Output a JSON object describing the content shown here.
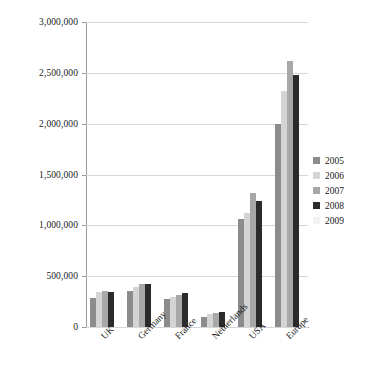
{
  "chart_data": {
    "type": "bar",
    "title": "",
    "subtitle": "",
    "xlabel": "",
    "ylabel": "",
    "categories": [
      "UK",
      "Germany",
      "France",
      "Netherlands",
      "USA",
      "Europe"
    ],
    "series": [
      {
        "name": "2005",
        "color": "#8c8c8c",
        "values": [
          290000,
          355000,
          280000,
          95000,
          1060000,
          2000000
        ]
      },
      {
        "name": "2006",
        "color": "#d4d4d4",
        "values": [
          345000,
          390000,
          300000,
          125000,
          1120000,
          2320000
        ]
      },
      {
        "name": "2007",
        "color": "#a8a8a8",
        "values": [
          350000,
          420000,
          310000,
          135000,
          1320000,
          2620000
        ]
      },
      {
        "name": "2008",
        "color": "#2b2b2b",
        "values": [
          345000,
          425000,
          330000,
          150000,
          1240000,
          2480000
        ]
      },
      {
        "name": "2009",
        "color": "#f2f2f2",
        "values": [
          0,
          0,
          0,
          0,
          0,
          0
        ]
      }
    ],
    "ylim": [
      0,
      3000000
    ],
    "ytick_values": [
      0,
      500000,
      1000000,
      1500000,
      2000000,
      2500000,
      3000000
    ],
    "ytick_labels": [
      "0",
      "500,000",
      "1,000,000",
      "1,500,000",
      "2,000,000",
      "2,500,000",
      "3,000,000"
    ],
    "grid": true,
    "grid_axis": "y",
    "legend_position": "right",
    "legend_entries": [
      "2005",
      "2006",
      "2007",
      "2008",
      "2009"
    ]
  }
}
